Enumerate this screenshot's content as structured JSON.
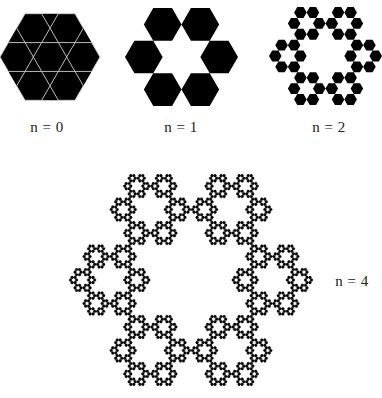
{
  "figure": {
    "type": "hexaflake-iterations",
    "colors": {
      "fill": "#000000",
      "background": "#ffffff",
      "inner_lines": "#cfcfcf"
    },
    "panels": [
      {
        "id": "n0",
        "label": "n = 0",
        "level": 0,
        "cx": 50,
        "cy": 57,
        "R": 50,
        "label_x": 47,
        "label_y": 127
      },
      {
        "id": "n1",
        "label": "n = 1",
        "level": 1,
        "cx": 181.5,
        "cy": 57,
        "R": 56.5,
        "label_x": 181,
        "label_y": 127
      },
      {
        "id": "n2",
        "label": "n = 2",
        "level": 2,
        "cx": 325.5,
        "cy": 56,
        "R": 56.5,
        "label_x": 329,
        "label_y": 127
      },
      {
        "id": "n4",
        "label": "n = 4",
        "level": 4,
        "cx": 191,
        "cy": 280,
        "R": 122,
        "label_x": 352,
        "label_y": 281
      }
    ]
  }
}
